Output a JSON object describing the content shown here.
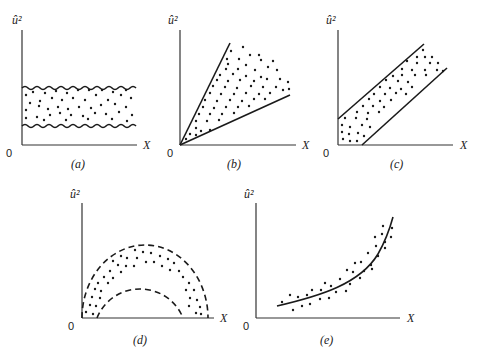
{
  "figure": {
    "y_axis_label": "û²",
    "x_axis_label": "X",
    "origin_label": "0",
    "panels": [
      {
        "id": "a",
        "caption": "(a)",
        "pattern": "constant band bounded by wavy lines"
      },
      {
        "id": "b",
        "caption": "(b)",
        "pattern": "fan / wedge widening with X"
      },
      {
        "id": "c",
        "caption": "(c)",
        "pattern": "linear increasing band"
      },
      {
        "id": "d",
        "caption": "(d)",
        "pattern": "semicircular (quadratic) band bounded by dashed arcs"
      },
      {
        "id": "e",
        "caption": "(e)",
        "pattern": "exponential / convex increasing curve with scatter"
      }
    ]
  }
}
